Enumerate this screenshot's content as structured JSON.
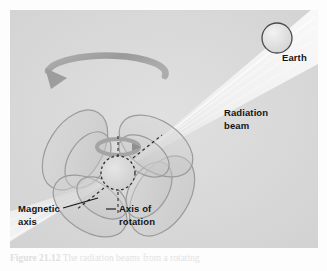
{
  "figure": {
    "panel": {
      "background_color": "#d9d9d9",
      "width": 308,
      "height": 238
    }
  },
  "labels": {
    "earth": "Earth",
    "radiation_beam_line1": "Radiation",
    "radiation_beam_line2": "beam",
    "magnetic_axis_line1": "Magnetic",
    "magnetic_axis_line2": "axis",
    "axis_of_rotation_line1": "Axis of",
    "axis_of_rotation_line2": "rotation"
  },
  "caption": {
    "number": "Figure 21.12",
    "text": "The radiation beams from a rotating"
  },
  "colors": {
    "panel_background": "#d9d9d9",
    "field_lobe_stroke": "#9a9a9a",
    "field_lobe_fill": "#cfcfcf",
    "star_fill": "#d6d6d6",
    "star_dash_stroke": "#3a3a3a",
    "beam_light": "#f2f2f2",
    "rotation_arrow": "#9d9d9d",
    "earth_fill": "#e8e8e8",
    "earth_stroke": "#4a4a4a",
    "label_text": "#141414",
    "leader_line": "#1a1a1a"
  },
  "geometry": {
    "star_center": [
      108,
      163
    ],
    "star_radius": 17,
    "earth_center": [
      267,
      28
    ],
    "earth_radius": 15,
    "rotation_axis_tilt_deg": 0,
    "magnetic_axis_tilt_deg": 40
  }
}
